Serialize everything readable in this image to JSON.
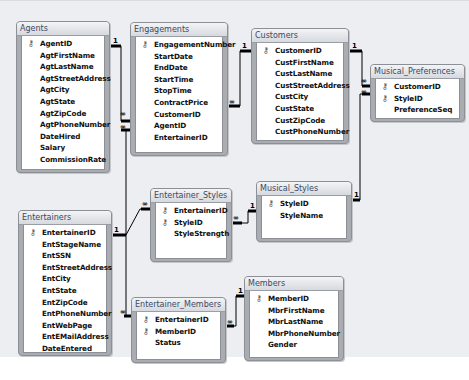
{
  "diagram": {
    "tables": [
      {
        "id": "agents",
        "name": "Agents",
        "x": 16,
        "y": 20,
        "w": 94,
        "h": 152,
        "fields": [
          {
            "name": "AgentID",
            "key": true
          },
          {
            "name": "AgtFirstName"
          },
          {
            "name": "AgtLastName"
          },
          {
            "name": "AgtStreetAddress"
          },
          {
            "name": "AgtCity"
          },
          {
            "name": "AgtState"
          },
          {
            "name": "AgtZipCode"
          },
          {
            "name": "AgtPhoneNumber"
          },
          {
            "name": "DateHired"
          },
          {
            "name": "Salary"
          },
          {
            "name": "CommissionRate"
          }
        ]
      },
      {
        "id": "engagements",
        "name": "Engagements",
        "x": 130,
        "y": 21,
        "w": 98,
        "h": 134,
        "fields": [
          {
            "name": "EngagementNumber",
            "key": true
          },
          {
            "name": "StartDate"
          },
          {
            "name": "EndDate"
          },
          {
            "name": "StartTime"
          },
          {
            "name": "StopTime"
          },
          {
            "name": "ContractPrice"
          },
          {
            "name": "CustomerID"
          },
          {
            "name": "AgentID"
          },
          {
            "name": "EntertainerID"
          }
        ]
      },
      {
        "id": "customers",
        "name": "Customers",
        "x": 251,
        "y": 27,
        "w": 98,
        "h": 116,
        "fields": [
          {
            "name": "CustomerID",
            "key": true
          },
          {
            "name": "CustFirstName"
          },
          {
            "name": "CustLastName"
          },
          {
            "name": "CustStreetAddress"
          },
          {
            "name": "CustCity"
          },
          {
            "name": "CustState"
          },
          {
            "name": "CustZipCode"
          },
          {
            "name": "CustPhoneNumber"
          }
        ]
      },
      {
        "id": "musical_preferences",
        "name": "Musical_Preferences",
        "x": 370,
        "y": 63,
        "w": 95,
        "h": 58,
        "fields": [
          {
            "name": "CustomerID",
            "key": true
          },
          {
            "name": "StyleID",
            "key": true
          },
          {
            "name": "PreferenceSeq"
          }
        ]
      },
      {
        "id": "entertainers",
        "name": "Entertainers",
        "x": 18,
        "y": 209,
        "w": 94,
        "h": 146,
        "fields": [
          {
            "name": "EntertainerID",
            "key": true
          },
          {
            "name": "EntStageName"
          },
          {
            "name": "EntSSN"
          },
          {
            "name": "EntStreetAddress"
          },
          {
            "name": "EntCity"
          },
          {
            "name": "EntState"
          },
          {
            "name": "EntZipCode"
          },
          {
            "name": "EntPhoneNumber"
          },
          {
            "name": "EntWebPage"
          },
          {
            "name": "EntEMailAddress"
          },
          {
            "name": "DateEntered"
          }
        ]
      },
      {
        "id": "entertainer_styles",
        "name": "Entertainer_Styles",
        "x": 150,
        "y": 187,
        "w": 82,
        "h": 74,
        "fields": [
          {
            "name": "EntertainerID",
            "key": true
          },
          {
            "name": "StyleID",
            "key": true
          },
          {
            "name": "StyleStrength"
          }
        ]
      },
      {
        "id": "musical_styles",
        "name": "Musical_Styles",
        "x": 256,
        "y": 180,
        "w": 96,
        "h": 61,
        "fields": [
          {
            "name": "StyleID",
            "key": true
          },
          {
            "name": "StyleName"
          }
        ]
      },
      {
        "id": "entertainer_members",
        "name": "Entertainer_Members",
        "x": 131,
        "y": 296,
        "w": 95,
        "h": 66,
        "fields": [
          {
            "name": "EntertainerID",
            "key": true
          },
          {
            "name": "MemberID",
            "key": true
          },
          {
            "name": "Status"
          }
        ]
      },
      {
        "id": "members",
        "name": "Members",
        "x": 244,
        "y": 275,
        "w": 100,
        "h": 85,
        "fields": [
          {
            "name": "MemberID",
            "key": true
          },
          {
            "name": "MbrFirstName"
          },
          {
            "name": "MbrLastName"
          },
          {
            "name": "MbrPhoneNumber"
          },
          {
            "name": "Gender"
          }
        ]
      }
    ],
    "relationships": [
      {
        "from": "Agents.AgentID",
        "to": "Engagements.AgentID",
        "from_card": "1",
        "to_card": "∞"
      },
      {
        "from": "Entertainers.EntertainerID",
        "to": "Engagements.EntertainerID",
        "from_card": "1",
        "to_card": "∞"
      },
      {
        "from": "Customers.CustomerID",
        "to": "Engagements.CustomerID",
        "from_card": "1",
        "to_card": "∞"
      },
      {
        "from": "Customers.CustomerID",
        "to": "Musical_Preferences.CustomerID",
        "from_card": "1",
        "to_card": "∞"
      },
      {
        "from": "Musical_Styles.StyleID",
        "to": "Musical_Preferences.StyleID",
        "from_card": "1",
        "to_card": "∞"
      },
      {
        "from": "Entertainers.EntertainerID",
        "to": "Entertainer_Styles.EntertainerID",
        "from_card": "1",
        "to_card": "∞"
      },
      {
        "from": "Musical_Styles.StyleID",
        "to": "Entertainer_Styles.StyleID",
        "from_card": "1",
        "to_card": "∞"
      },
      {
        "from": "Entertainers.EntertainerID",
        "to": "Entertainer_Members.EntertainerID",
        "from_card": "1",
        "to_card": "∞"
      },
      {
        "from": "Members.MemberID",
        "to": "Entertainer_Members.MemberID",
        "from_card": "1",
        "to_card": "∞"
      }
    ],
    "icons": {
      "primary_key": "key-icon"
    }
  }
}
